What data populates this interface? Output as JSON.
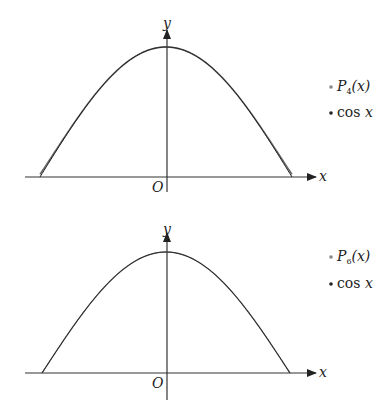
{
  "chart_data": [
    {
      "type": "line",
      "title": "",
      "xlabel": "x",
      "ylabel": "y",
      "origin_label": "O",
      "xlim": [
        -1.5708,
        1.5708
      ],
      "ylim": [
        0,
        1
      ],
      "grid": false,
      "legend_position": "right",
      "series": [
        {
          "name": "P_4(x)",
          "label_main": "P",
          "label_sub": "4",
          "label_rest": "(x)",
          "color": "#555555",
          "function": "1 - x^2/2 + x^4/24"
        },
        {
          "name": "cos x",
          "label_main": "cos",
          "label_rest": "x",
          "color": "#222222",
          "function": "cos(x)"
        }
      ]
    },
    {
      "type": "line",
      "title": "",
      "xlabel": "x",
      "ylabel": "y",
      "origin_label": "O",
      "xlim": [
        -1.5708,
        1.5708
      ],
      "ylim": [
        0,
        1
      ],
      "grid": false,
      "legend_position": "right",
      "series": [
        {
          "name": "P_6(x)",
          "label_main": "P",
          "label_sub": "6",
          "label_rest": "(x)",
          "color": "#555555",
          "function": "1 - x^2/2 + x^4/24 - x^6/720"
        },
        {
          "name": "cos x",
          "label_main": "cos",
          "label_rest": "x",
          "color": "#222222",
          "function": "cos(x)"
        }
      ]
    }
  ]
}
